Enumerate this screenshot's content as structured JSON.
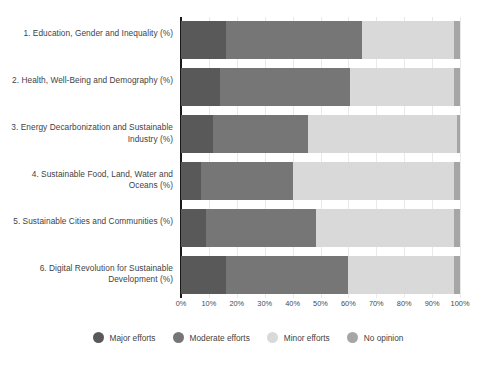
{
  "chart_data": {
    "type": "bar",
    "orientation": "horizontal",
    "stacked": true,
    "normalized_percent": true,
    "title": "",
    "subtitle": "",
    "xlabel": "",
    "ylabel": "",
    "xlim": [
      0,
      100
    ],
    "xticks": [
      0,
      10,
      20,
      30,
      40,
      50,
      60,
      70,
      80,
      90,
      100
    ],
    "xtick_labels": [
      "0%",
      "10%",
      "20%",
      "30%",
      "40%",
      "50%",
      "60%",
      "70%",
      "80%",
      "90%",
      "100%"
    ],
    "grid": true,
    "grid_axis": "x",
    "legend_position": "bottom-center",
    "categories": [
      "1. Education, Gender and Inequality (%)",
      "2. Health, Well-Being and Demography (%)",
      "3. Energy Decarbonization and Sustainable Industry (%)",
      "4. Sustainable Food, Land, Water and Oceans (%)",
      "5. Sustainable Cities and Communities (%)",
      "6. Digital Revolution for Sustainable Development (%)"
    ],
    "series": [
      {
        "name": "Major efforts",
        "color": "#595959",
        "values": [
          16,
          14,
          11.5,
          7,
          9,
          16
        ]
      },
      {
        "name": "Moderate efforts",
        "color": "#767676",
        "values": [
          49,
          46.5,
          34,
          33,
          39.5,
          44
        ]
      },
      {
        "name": "Minor efforts",
        "color": "#d9d9d9",
        "values": [
          33,
          37.5,
          53.5,
          58,
          49.5,
          38
        ]
      },
      {
        "name": "No opinion",
        "color": "#a6a6a6",
        "values": [
          2,
          2,
          1,
          2,
          2,
          2
        ]
      }
    ]
  },
  "legend": {
    "items": [
      {
        "label": "Major efforts",
        "color": "#595959",
        "icon": "circle-swatch-icon"
      },
      {
        "label": "Moderate efforts",
        "color": "#767676",
        "icon": "circle-swatch-icon"
      },
      {
        "label": "Minor efforts",
        "color": "#d9d9d9",
        "icon": "circle-swatch-icon"
      },
      {
        "label": "No opinion",
        "color": "#a6a6a6",
        "icon": "circle-swatch-icon"
      }
    ]
  },
  "colors": {
    "background": "#ffffff",
    "axis": "#1a1a1a",
    "gridline": "#e9e9e9",
    "text": "#3f3f3f"
  }
}
